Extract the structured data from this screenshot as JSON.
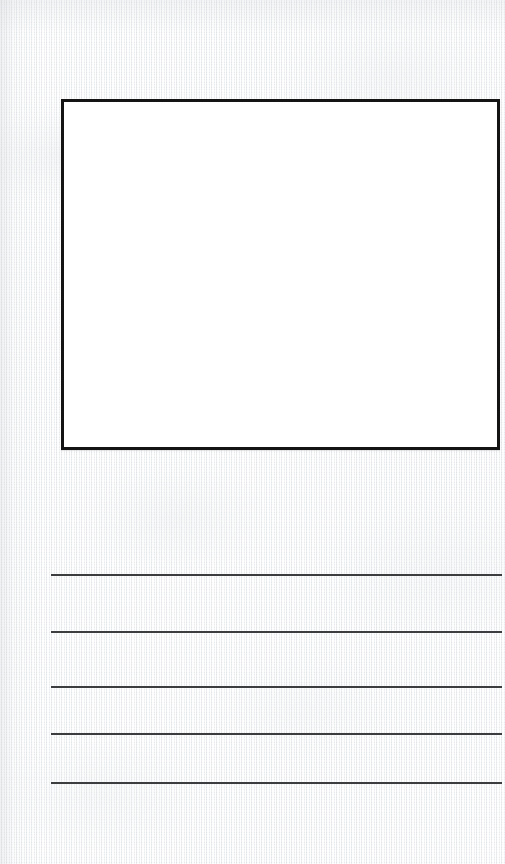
{
  "page": {
    "kind": "draw-and-write-worksheet",
    "width": 505,
    "height": 864,
    "background_color": "#f1f2f3",
    "paper_texture": "woven-canvas"
  },
  "drawing_box": {
    "label": "",
    "content": "",
    "fill_color": "#ffffff",
    "border_color": "#141414",
    "border_width": 3,
    "x": 61,
    "y": 99,
    "width": 439,
    "height": 351
  },
  "writing_area": {
    "line_color": "#3b3d3f",
    "line_thickness": 2,
    "line_left": 51,
    "line_width": 451,
    "line_count": 5,
    "lines": [
      {
        "index": 1,
        "y": 574,
        "text": ""
      },
      {
        "index": 2,
        "y": 631,
        "text": ""
      },
      {
        "index": 3,
        "y": 686,
        "text": ""
      },
      {
        "index": 4,
        "y": 733,
        "text": ""
      },
      {
        "index": 5,
        "y": 782,
        "text": ""
      }
    ]
  }
}
